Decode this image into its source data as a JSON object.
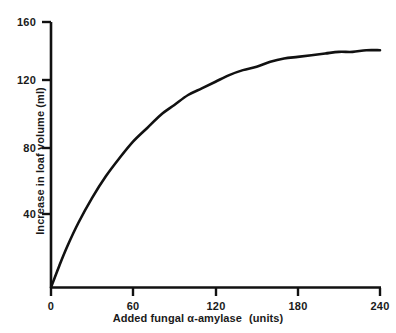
{
  "chart_data": {
    "type": "line",
    "title": "",
    "xlabel_prefix": "Added fungal α-amylase",
    "xlabel_suffix": "(units)",
    "xlabel": "Added fungal α-amylase  (units)",
    "ylabel": "Increase in loaf volume (ml)",
    "xlim": [
      0,
      240
    ],
    "ylim": [
      0,
      160
    ],
    "xticks": [
      0,
      60,
      120,
      180,
      240
    ],
    "xtick_labels": [
      "0",
      "60",
      "120",
      "180",
      "240"
    ],
    "yticks": [
      40,
      80,
      120,
      160
    ],
    "ytick_labels": [
      "40",
      "80",
      "120",
      "160"
    ],
    "grid": false,
    "legend": false,
    "line_color": "#111111",
    "axis_color": "#111111",
    "background_color": "#ffffff",
    "series": [
      {
        "name": "Increase in loaf volume",
        "x": [
          0,
          6,
          12,
          20,
          30,
          40,
          50,
          60,
          70,
          80,
          90,
          100,
          110,
          120,
          130,
          140,
          150,
          160,
          170,
          180,
          190,
          200,
          210,
          220,
          230,
          240
        ],
        "values": [
          0,
          13,
          25,
          39,
          54,
          67,
          78,
          88,
          96,
          104,
          110,
          116,
          120,
          124,
          128,
          131,
          133,
          136,
          138,
          139,
          140,
          141,
          142,
          142,
          143,
          143
        ]
      }
    ],
    "annotations": {
      "plateau_value": 143,
      "curve_shape": "saturating exponential rise to plateau"
    }
  },
  "axes": {
    "y_axis_name": "y-axis",
    "x_axis_name": "x-axis"
  }
}
